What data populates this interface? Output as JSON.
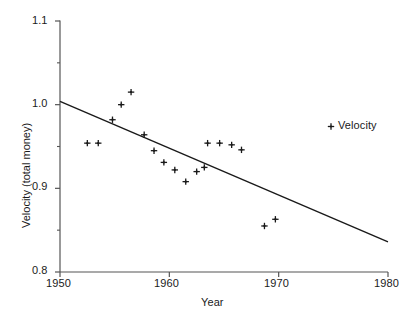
{
  "chart_data": {
    "type": "scatter",
    "title": "",
    "xlabel": "Year",
    "ylabel": "Velocity (total money)",
    "xlim": [
      1950,
      1980
    ],
    "ylim": [
      0.8,
      1.1
    ],
    "xticks": [
      1950,
      1960,
      1970,
      1980
    ],
    "xtick_labels": [
      "1950",
      "1960",
      "1970",
      "1980"
    ],
    "yticks": [
      0.8,
      0.9,
      1.0,
      1.1
    ],
    "ytick_labels": [
      "0.8",
      "0.9",
      "1.0",
      "1.1"
    ],
    "yminor_ticks": [
      0.85,
      0.95,
      1.05
    ],
    "grid": false,
    "legend": {
      "position": "upper-right-inside",
      "entries": [
        {
          "label": "Velocity",
          "marker": "plus",
          "color": "#1a1a1a"
        }
      ]
    },
    "series": [
      {
        "name": "Velocity",
        "marker": "plus",
        "color": "#1a1a1a",
        "points": [
          {
            "x": 1952.5,
            "y": 0.954
          },
          {
            "x": 1953.5,
            "y": 0.954
          },
          {
            "x": 1954.8,
            "y": 0.982
          },
          {
            "x": 1955.6,
            "y": 1.0
          },
          {
            "x": 1956.5,
            "y": 1.015
          },
          {
            "x": 1957.7,
            "y": 0.964
          },
          {
            "x": 1958.6,
            "y": 0.945
          },
          {
            "x": 1959.5,
            "y": 0.931
          },
          {
            "x": 1960.5,
            "y": 0.922
          },
          {
            "x": 1961.5,
            "y": 0.908
          },
          {
            "x": 1962.5,
            "y": 0.92
          },
          {
            "x": 1963.2,
            "y": 0.925
          },
          {
            "x": 1963.5,
            "y": 0.954
          },
          {
            "x": 1964.6,
            "y": 0.954
          },
          {
            "x": 1965.7,
            "y": 0.952
          },
          {
            "x": 1966.6,
            "y": 0.946
          },
          {
            "x": 1968.7,
            "y": 0.855
          },
          {
            "x": 1969.7,
            "y": 0.863
          }
        ]
      }
    ],
    "trend_line": {
      "name": "linear-fit",
      "color": "#1a1a1a",
      "x_start": 1950,
      "y_start": 1.004,
      "x_end": 1980,
      "y_end": 0.836
    }
  },
  "axes": {
    "x_title": "Year",
    "y_title": "Velocity (total money)",
    "x_tick_labels": [
      "1950",
      "1960",
      "1970",
      "1980"
    ],
    "y_tick_labels": [
      "1.1",
      "1.0",
      "0.9",
      "0.8"
    ]
  },
  "legend": {
    "velocity_label": "Velocity",
    "marker_glyph": "+"
  },
  "colors": {
    "ink": "#1a1a1a",
    "axis": "#555555",
    "background": "#ffffff"
  }
}
